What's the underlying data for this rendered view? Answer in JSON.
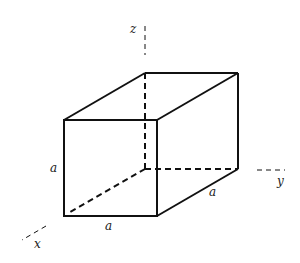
{
  "diagram": {
    "type": "cube-with-axes",
    "axes": {
      "x_label": "x",
      "y_label": "y",
      "z_label": "z"
    },
    "edge_labels": {
      "vertical": "a",
      "front_bottom": "a",
      "side_bottom": "a"
    },
    "colors": {
      "stroke": "#111111",
      "background": "#ffffff"
    }
  }
}
